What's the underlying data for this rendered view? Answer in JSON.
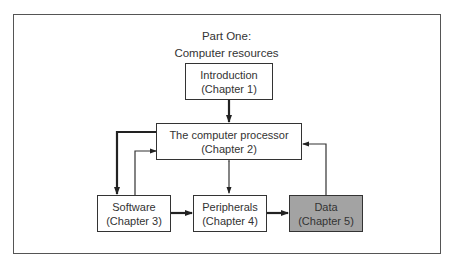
{
  "diagram": {
    "title_line1": "Part One:",
    "title_line2": "Computer resources",
    "nodes": [
      {
        "id": "intro",
        "label": "Introduction",
        "sub": "(Chapter 1)",
        "shaded": false
      },
      {
        "id": "processor",
        "label": "The computer processor",
        "sub": "(Chapter 2)",
        "shaded": false
      },
      {
        "id": "software",
        "label": "Software",
        "sub": "(Chapter 3)",
        "shaded": false
      },
      {
        "id": "peripherals",
        "label": "Peripherals",
        "sub": "(Chapter 4)",
        "shaded": false
      },
      {
        "id": "data",
        "label": "Data",
        "sub": "(Chapter 5)",
        "shaded": true
      }
    ],
    "edges": [
      {
        "from": "intro",
        "to": "processor",
        "weight": "thick"
      },
      {
        "from": "processor",
        "to": "software",
        "weight": "thick"
      },
      {
        "from": "software",
        "to": "processor",
        "weight": "thin"
      },
      {
        "from": "processor",
        "to": "peripherals",
        "weight": "thin",
        "bidirectional": true
      },
      {
        "from": "software",
        "to": "peripherals",
        "weight": "thick"
      },
      {
        "from": "peripherals",
        "to": "data",
        "weight": "thick"
      },
      {
        "from": "data",
        "to": "processor",
        "weight": "thin"
      }
    ],
    "colors": {
      "border": "#333333",
      "shaded_fill": "#a3a3a3",
      "frame": "#555555"
    }
  }
}
